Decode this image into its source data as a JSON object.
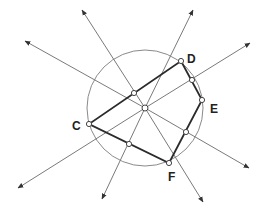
{
  "diagram": {
    "colors": {
      "circle": "#8a8a8a",
      "bisector": "#7a7a7a",
      "polygon": "#2b2b2b",
      "point_fill": "#ffffff",
      "point_stroke": "#444444",
      "label": "#222222"
    },
    "circle": {
      "cx": 145,
      "cy": 108,
      "r": 58
    },
    "center_point": {
      "x": 145,
      "y": 108
    },
    "vertices": [
      {
        "name": "D",
        "x": 181,
        "y": 61,
        "label_x": 187,
        "label_y": 63
      },
      {
        "name": "E",
        "x": 202,
        "y": 100,
        "label_x": 210,
        "label_y": 113
      },
      {
        "name": "F",
        "x": 169,
        "y": 163,
        "label_x": 168,
        "label_y": 181
      },
      {
        "name": "C",
        "x": 89,
        "y": 124,
        "label_x": 72,
        "label_y": 130
      }
    ],
    "labels": {
      "D": "D",
      "E": "E",
      "F": "F",
      "C": "C"
    },
    "midpoints": [
      {
        "segment": "CD",
        "x": 134,
        "y": 93
      },
      {
        "segment": "DE",
        "x": 192,
        "y": 80
      },
      {
        "segment": "EF",
        "x": 186,
        "y": 132
      },
      {
        "segment": "FC",
        "x": 129,
        "y": 144
      }
    ],
    "bisector_rays": [
      {
        "from": [
          145,
          108
        ],
        "to": [
          25,
          41
        ]
      },
      {
        "from": [
          145,
          108
        ],
        "to": [
          249,
          168
        ]
      },
      {
        "from": [
          145,
          108
        ],
        "to": [
          82,
          10
        ]
      },
      {
        "from": [
          145,
          108
        ],
        "to": [
          203,
          202
        ]
      },
      {
        "from": [
          145,
          108
        ],
        "to": [
          193,
          10
        ]
      },
      {
        "from": [
          145,
          108
        ],
        "to": [
          102,
          199
        ]
      },
      {
        "from": [
          145,
          108
        ],
        "to": [
          250,
          43
        ]
      },
      {
        "from": [
          145,
          108
        ],
        "to": [
          18,
          188
        ]
      }
    ]
  }
}
